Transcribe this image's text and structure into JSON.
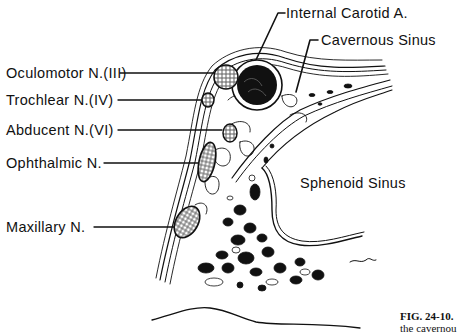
{
  "figure": {
    "labels": {
      "internal_carotid": "Internal Carotid A.",
      "cavernous_sinus": "Cavernous Sinus",
      "oculomotor": "Oculomotor N.(III)",
      "trochlear": "Trochlear N.(IV)",
      "abducent": "Abducent N.(VI)",
      "ophthalmic": "Ophthalmic N.",
      "maxillary": "Maxillary N.",
      "sphenoid_sinus": "Sphenoid Sinus"
    },
    "caption": {
      "number": "FIG. 24-10.",
      "line2": "the cavernou"
    }
  }
}
